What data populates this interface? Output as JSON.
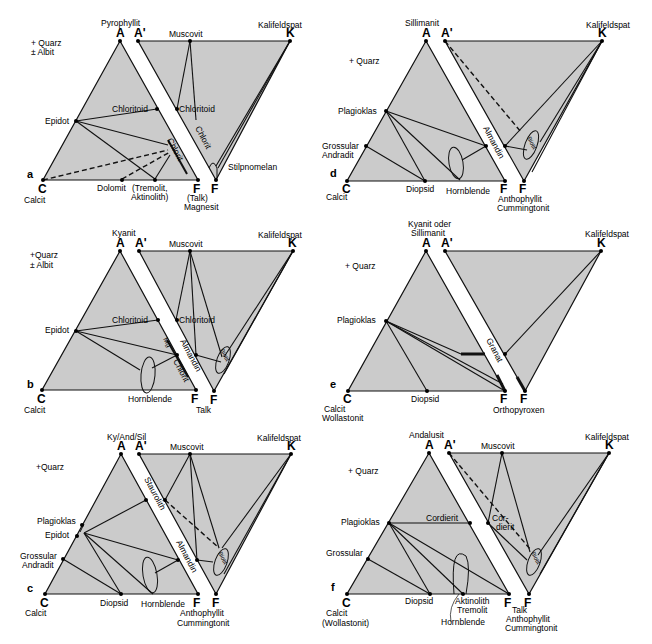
{
  "figure": {
    "panels": [
      {
        "id": "a",
        "letter": "a",
        "assemblage": [
          "+ Quarz",
          "± Albit"
        ],
        "vertices": {
          "A": "A",
          "A_prime": "A'",
          "C": "C",
          "F": "F",
          "F_prime": "F",
          "K": "K"
        },
        "vertex_minerals": {
          "A": "Pyrophyllit",
          "K": "Kalifeldspat",
          "C": "Calcit",
          "F": "(Talk)",
          "F2": "Magnesit"
        },
        "phases_ACF": [
          "Epidot",
          "Chloritoid",
          "Chlorit",
          "Dolomit",
          "(Tremolit,",
          "Aktinolith)"
        ],
        "phases_AKF": [
          "Muscovit",
          "Chloritoid",
          "Chlorit",
          "Stilpnomelan"
        ]
      },
      {
        "id": "d",
        "letter": "d",
        "assemblage": [
          "+ Quarz"
        ],
        "vertices": {
          "A": "A",
          "A_prime": "A'",
          "C": "C",
          "F": "F",
          "F_prime": "F",
          "K": "K"
        },
        "vertex_minerals": {
          "A": "Sillimanit",
          "K": "Kalifeldspat",
          "C": "Calcit",
          "F": "Anthophyllit",
          "F2": "Cummingtonit"
        },
        "phases_ACF": [
          "Plagioklas",
          "Grossular",
          "Andradit",
          "Diopsid",
          "Hornblende",
          "Almandin"
        ],
        "phases_AKF": [
          "Biotit"
        ]
      },
      {
        "id": "b",
        "letter": "b",
        "assemblage": [
          "+Quarz",
          "± Albit"
        ],
        "vertices": {
          "A": "A",
          "A_prime": "A'",
          "C": "C",
          "F": "F",
          "F_prime": "F",
          "K": "K"
        },
        "vertex_minerals": {
          "A": "Kyanit",
          "K": "Kalifeldspat",
          "C": "Calcit",
          "F": "Talk"
        },
        "phases_ACF": [
          "Chloritoid",
          "Epidot",
          "Mg",
          "Chlorit",
          "Almandin",
          "Hornblende"
        ],
        "phases_AKF": [
          "Muscovit",
          "Chloritoid",
          "Biotit"
        ]
      },
      {
        "id": "e",
        "letter": "e",
        "assemblage": [
          "+ Quarz"
        ],
        "vertices": {
          "A": "A",
          "A_prime": "A'",
          "C": "C",
          "F": "F",
          "F_prime": "F",
          "K": "K"
        },
        "vertex_minerals": {
          "A1": "Kyanit oder",
          "A2": "Sillimanit",
          "K": "Kalifeldspat",
          "C1": "Calcit",
          "C2": "Wollastonit",
          "F": "Orthopyroxen"
        },
        "phases_ACF": [
          "Plagioklas",
          "Diopsid",
          "Granat"
        ],
        "phases_AKF": []
      },
      {
        "id": "c",
        "letter": "c",
        "assemblage": [
          "+Quarz"
        ],
        "vertices": {
          "A": "A",
          "A_prime": "A'",
          "C": "C",
          "F": "F",
          "F_prime": "F",
          "K": "K"
        },
        "vertex_minerals": {
          "A": "Ky/And/Sil",
          "K": "Kalifeldspat",
          "C": "Calcit",
          "F": "Anthophyllit",
          "F2": "Cummingtonit"
        },
        "phases_ACF": [
          "Plagioklas",
          "Epidot",
          "Grossular",
          "Andradit",
          "Diopsid",
          "Hornblende",
          "Staurolith",
          "Almandin"
        ],
        "phases_AKF": [
          "Muscovit",
          "Biotit"
        ]
      },
      {
        "id": "f",
        "letter": "f",
        "assemblage": [
          "+ Quarz"
        ],
        "vertices": {
          "A": "A",
          "A_prime": "A'",
          "C": "C",
          "F": "F",
          "F_prime": "F",
          "K": "K"
        },
        "vertex_minerals": {
          "A": "Andalusit",
          "K": "Kalifeldspat",
          "C1": "Calcit",
          "C2": "(Wollastonit)",
          "F1": "Talk",
          "F2": "Anthophyllit",
          "F3": "Cummingtonit"
        },
        "phases_ACF": [
          "Plagioklas",
          "Cordierit",
          "Grossular",
          "Diopsid",
          "Aktinolith",
          "Tremolit",
          "Hornblende"
        ],
        "phases_AKF": [
          "Muscovit",
          "Cor-",
          "dierit",
          "Biotit"
        ]
      }
    ]
  },
  "colors": {
    "fill": "#cbcbcb",
    "line": "#111111",
    "background": "#ffffff"
  }
}
